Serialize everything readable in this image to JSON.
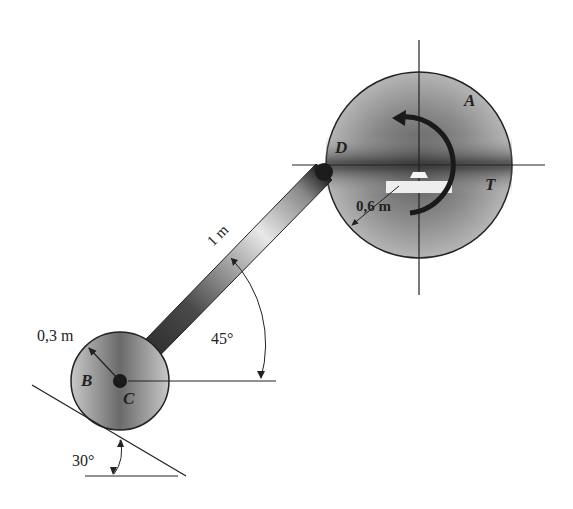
{
  "figure": {
    "labels": {
      "A": "A",
      "B": "B",
      "C": "C",
      "D": "D",
      "T": "T"
    },
    "dimensions": {
      "large_radius": "0,6 m",
      "small_radius": "0,3 m",
      "rod_length": "1 m",
      "rod_angle": "45°",
      "incline_angle": "30°"
    },
    "colors": {
      "line": "#222222",
      "rod_dark": "#2a2a2a",
      "disk_fill": "#9a9a9a",
      "background": "#ffffff"
    }
  }
}
